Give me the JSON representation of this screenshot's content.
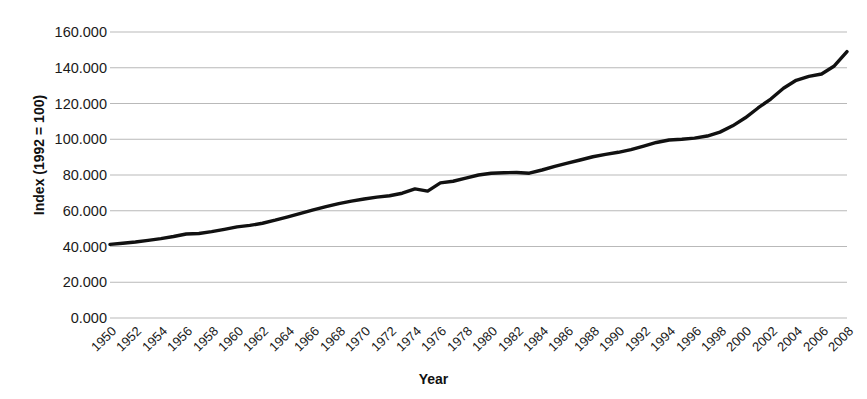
{
  "chart_data": {
    "type": "line",
    "title": "",
    "xlabel": "Year",
    "ylabel": "Index (1992 = 100)",
    "xlim": [
      1950,
      2008
    ],
    "ylim": [
      0,
      160
    ],
    "grid": true,
    "legend": "none",
    "y_ticks": [
      "0.000",
      "20.000",
      "40.000",
      "60.000",
      "80.000",
      "100.000",
      "120.000",
      "140.000",
      "160.000"
    ],
    "y_tick_values": [
      0,
      20,
      40,
      60,
      80,
      100,
      120,
      140,
      160
    ],
    "x_ticks": [
      "1950",
      "1952",
      "1954",
      "1956",
      "1958",
      "1960",
      "1962",
      "1964",
      "1966",
      "1968",
      "1970",
      "1972",
      "1974",
      "1976",
      "1978",
      "1980",
      "1982",
      "1984",
      "1986",
      "1988",
      "1990",
      "1992",
      "1994",
      "1996",
      "1998",
      "2000",
      "2002",
      "2004",
      "2006",
      "2008"
    ],
    "series": [
      {
        "name": "Index (1992 = 100)",
        "color": "#111111",
        "x": [
          1950,
          1951,
          1952,
          1953,
          1954,
          1955,
          1956,
          1957,
          1958,
          1959,
          1960,
          1961,
          1962,
          1963,
          1964,
          1965,
          1966,
          1967,
          1968,
          1969,
          1970,
          1971,
          1972,
          1973,
          1974,
          1975,
          1976,
          1977,
          1978,
          1979,
          1980,
          1981,
          1982,
          1983,
          1984,
          1985,
          1986,
          1987,
          1988,
          1989,
          1990,
          1991,
          1992,
          1993,
          1994,
          1995,
          1996,
          1997,
          1998,
          1999,
          2000,
          2001,
          2002,
          2003,
          2004,
          2005,
          2006,
          2007,
          2008
        ],
        "values": [
          41.2,
          41.8,
          42.5,
          43.4,
          44.4,
          45.6,
          47.0,
          47.3,
          48.3,
          49.6,
          51.0,
          51.8,
          53.0,
          54.7,
          56.6,
          58.5,
          60.5,
          62.3,
          64.0,
          65.4,
          66.6,
          67.6,
          68.4,
          69.8,
          72.2,
          71.0,
          75.6,
          76.5,
          78.2,
          80.0,
          81.0,
          81.3,
          81.4,
          81.0,
          82.8,
          84.8,
          86.6,
          88.4,
          90.2,
          91.5,
          92.7,
          94.2,
          96.2,
          98.2,
          99.6,
          100.0,
          100.6,
          101.8,
          104.0,
          107.5,
          112.0,
          117.5,
          122.5,
          128.5,
          133.0,
          135.2,
          136.5,
          141.0,
          149.0
        ]
      }
    ]
  },
  "axes": {
    "plot_left": 110,
    "plot_right": 847,
    "plot_top": 32,
    "plot_bottom": 318
  }
}
